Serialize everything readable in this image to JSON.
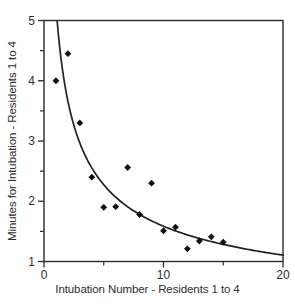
{
  "chart_data": {
    "type": "scatter",
    "title": "",
    "xlabel": "Intubation Number - Residents 1 to 4",
    "ylabel": "Minutes for Intubation - Residents 1 to 4",
    "xlim": [
      0,
      20
    ],
    "ylim": [
      1,
      5
    ],
    "x_major_ticks": [
      0,
      10,
      20
    ],
    "x_minor_ticks": [
      5,
      15
    ],
    "y_major_ticks": [
      1,
      2,
      3,
      4,
      5
    ],
    "y_minor_ticks": [
      1.5,
      2.5,
      3.5,
      4.5
    ],
    "grid": false,
    "legend": "none",
    "marker": "diamond",
    "points": [
      [
        1,
        4.0
      ],
      [
        2,
        4.45
      ],
      [
        3,
        3.3
      ],
      [
        4,
        2.4
      ],
      [
        5,
        1.9
      ],
      [
        6,
        1.91
      ],
      [
        7,
        2.56
      ],
      [
        8,
        1.78
      ],
      [
        9,
        2.3
      ],
      [
        10,
        1.51
      ],
      [
        11,
        1.57
      ],
      [
        12,
        1.21
      ],
      [
        13,
        1.34
      ],
      [
        14,
        1.41
      ],
      [
        15,
        1.32
      ]
    ],
    "fit_curve": {
      "type": "power",
      "a": 5.25,
      "b": -0.52
    },
    "colors": {
      "line": "#222222",
      "frame": "#2b2b2b",
      "marker": "#111111",
      "text": "#2e2e2e",
      "background": "#ffffff"
    }
  }
}
